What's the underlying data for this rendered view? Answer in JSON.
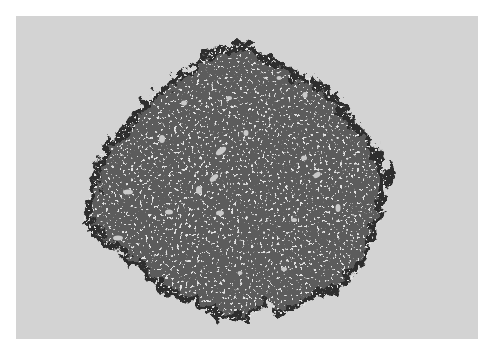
{
  "figure": {
    "colors": {
      "page_background": "#ffffff",
      "panel_background": "#d3d3d3",
      "cluster_fill": "#5c5c5c",
      "cluster_edge": "#2e2e2e",
      "hole_fill": "#c8c8c8"
    },
    "cluster": {
      "center": [
        240,
        185
      ],
      "approx_radius": [
        150,
        135
      ]
    }
  }
}
